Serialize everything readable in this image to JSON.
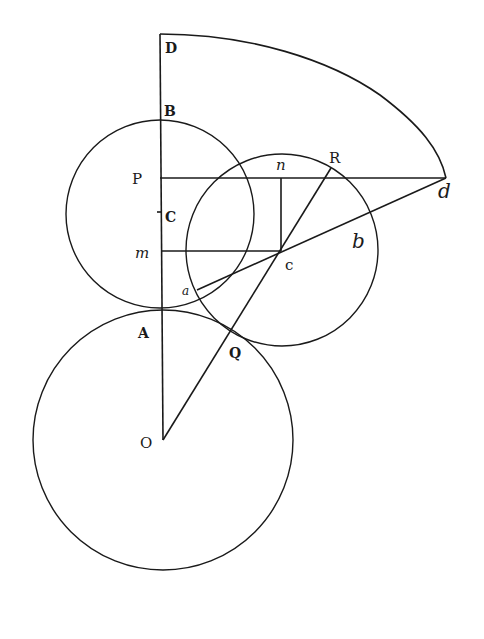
{
  "diagram": {
    "type": "geometric-construction",
    "labels": {
      "D": "D",
      "B": "B",
      "P": "P",
      "C": "C",
      "m": "m",
      "a": "a",
      "A": "A",
      "Q": "Q",
      "O": "O",
      "n": "n",
      "R": "R",
      "c": "c",
      "b": "b",
      "d": "d"
    },
    "points": {
      "D": [
        160,
        34
      ],
      "B": [
        160,
        117
      ],
      "P": [
        160,
        178
      ],
      "C": [
        160,
        212
      ],
      "m": [
        160,
        251
      ],
      "A": [
        162,
        310
      ],
      "O": [
        163,
        440
      ],
      "n": [
        281,
        178
      ],
      "R": [
        330,
        168
      ],
      "c": [
        281,
        251
      ],
      "Q": [
        233,
        331
      ],
      "a": [
        197,
        290
      ],
      "b": [
        372,
        211
      ],
      "d": [
        446,
        178
      ]
    },
    "circles": [
      {
        "name": "circle-O",
        "center": "O",
        "radius": 130
      },
      {
        "name": "circle-C",
        "center": "C",
        "radius": 94
      },
      {
        "name": "circle-c",
        "center": "c",
        "radius": 96
      }
    ],
    "segments": [
      [
        "D",
        "O"
      ],
      [
        "P",
        "d"
      ],
      [
        "m",
        "c"
      ],
      [
        "n",
        "c"
      ],
      [
        "O",
        "R"
      ],
      [
        "a",
        "d"
      ]
    ],
    "curves": [
      {
        "name": "arc-D-d",
        "from": "D",
        "to": "d"
      }
    ]
  }
}
